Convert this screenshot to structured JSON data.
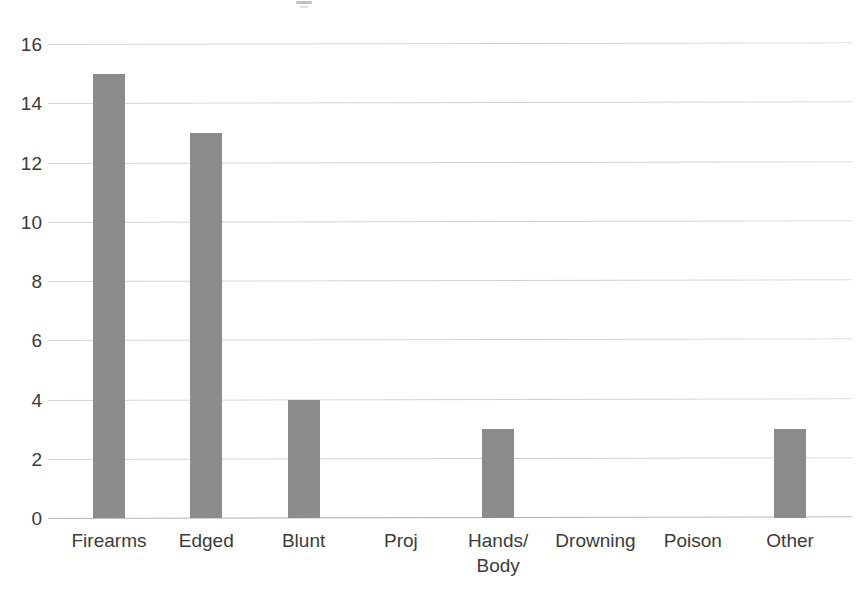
{
  "chart_data": {
    "type": "bar",
    "title": "",
    "xlabel": "",
    "ylabel": "",
    "categories": [
      "Firearms",
      "Edged",
      "Blunt",
      "Proj",
      "Hands/\nBody",
      "Drowning",
      "Poison",
      "Other"
    ],
    "values": [
      15,
      13,
      4,
      0,
      3,
      0,
      0,
      3
    ],
    "series": [
      {
        "name": "Count",
        "values": [
          15,
          13,
          4,
          0,
          3,
          0,
          0,
          3
        ]
      }
    ],
    "ylim": [
      0,
      16
    ],
    "y_ticks": [
      "0",
      "2",
      "4",
      "6",
      "8",
      "10",
      "12",
      "14",
      "16"
    ],
    "y_tick_values": [
      0,
      2,
      4,
      6,
      8,
      10,
      12,
      14,
      16
    ],
    "grid": "horizontal",
    "legend": "none",
    "bar_color": "#8c8c8c",
    "gridline_color": "#d4d4d7",
    "text_color": "#3b3b3b",
    "background_color": "#ffffff"
  }
}
